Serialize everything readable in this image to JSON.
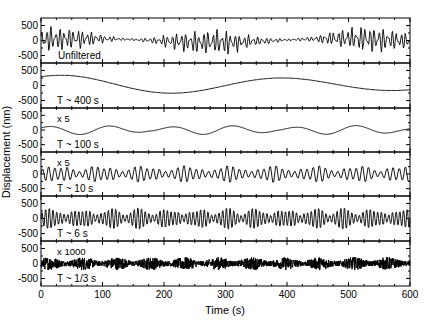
{
  "chart_data": {
    "type": "line",
    "title": "",
    "xlabel": "Time (s)",
    "ylabel": "Displacement (nm)",
    "xlim": [
      0,
      600
    ],
    "x_ticks": [
      0,
      100,
      200,
      300,
      400,
      500,
      600
    ],
    "x_tick_labels": [
      "0",
      "100",
      "200",
      "300",
      "400",
      "500",
      "600"
    ],
    "x_minor_step": 25,
    "ylim": [
      -750,
      750
    ],
    "y_ticks": [
      -500,
      0,
      500
    ],
    "y_tick_labels": [
      "-500",
      "0",
      "500"
    ],
    "grid": false,
    "legend": "none",
    "panels": [
      {
        "label": "Unfiltered",
        "scale_note": "",
        "kind": "broadband",
        "period_s": null,
        "amplitude_nm": 450,
        "description": "raw record: high-frequency signal on top of slow drift"
      },
      {
        "label": "T ~ 400 s",
        "scale_note": "",
        "kind": "sine",
        "period_s": 400,
        "amplitude_nm": 330,
        "description": "long-period component, smooth ~1.5 cycles"
      },
      {
        "label": "T ~ 100 s",
        "scale_note": "x 5",
        "kind": "sine",
        "period_s": 100,
        "amplitude_nm": 220,
        "description": "amplified x5, beating envelope"
      },
      {
        "label": "T ~ 10 s",
        "scale_note": "x 5",
        "kind": "narrowband",
        "period_s": 10,
        "amplitude_nm": 320,
        "description": "amplified x5, microseism band"
      },
      {
        "label": "T ~ 6 s",
        "scale_note": "",
        "kind": "narrowband",
        "period_s": 6,
        "amplitude_nm": 400,
        "description": "secondary microseism band, packetized envelope"
      },
      {
        "label": "T ~ 1/3 s",
        "scale_note": "x 1000",
        "kind": "noise",
        "period_s": 0.333,
        "amplitude_nm": 220,
        "description": "amplified x1000, dense high-frequency noise"
      }
    ]
  },
  "ui": {
    "line_color": "#000000",
    "background": "#ffffff"
  }
}
